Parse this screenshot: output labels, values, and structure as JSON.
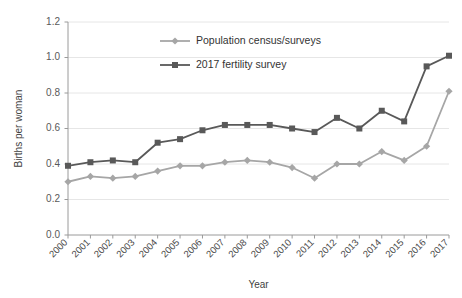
{
  "chart_data": {
    "type": "line",
    "title": "",
    "xlabel": "Year",
    "ylabel": "Births per woman",
    "categories": [
      "2000",
      "2001",
      "2002",
      "2003",
      "2004",
      "2005",
      "2006",
      "2007",
      "2008",
      "2009",
      "2010",
      "2011",
      "2012",
      "2013",
      "2014",
      "2015",
      "2016",
      "2017"
    ],
    "x": [
      2000,
      2001,
      2002,
      2003,
      2004,
      2005,
      2006,
      2007,
      2008,
      2009,
      2010,
      2011,
      2012,
      2013,
      2014,
      2015,
      2016,
      2017
    ],
    "ylim": [
      0.0,
      1.2
    ],
    "yticks": [
      0.0,
      0.2,
      0.4,
      0.6,
      0.8,
      1.0,
      1.2
    ],
    "ytick_labels": [
      "0.0",
      "0.2",
      "0.4",
      "0.6",
      "0.8",
      "1.0",
      "1.2"
    ],
    "grid": "horizontal",
    "legend_position": "inside-top-center",
    "series": [
      {
        "name": "Population census/surveys",
        "color": "#a6a6a6",
        "marker": "diamond",
        "values": [
          0.3,
          0.33,
          0.32,
          0.33,
          0.36,
          0.39,
          0.39,
          0.41,
          0.42,
          0.41,
          0.38,
          0.32,
          0.4,
          0.4,
          0.47,
          0.42,
          0.5,
          0.81
        ]
      },
      {
        "name": "2017 fertility survey",
        "color": "#595959",
        "marker": "square",
        "values": [
          0.39,
          0.41,
          0.42,
          0.41,
          0.52,
          0.54,
          0.59,
          0.62,
          0.62,
          0.62,
          0.6,
          0.58,
          0.66,
          0.6,
          0.7,
          0.64,
          0.95,
          1.01
        ]
      }
    ]
  },
  "axis": {
    "y_title": "Births per woman",
    "x_title": "Year"
  },
  "legend": {
    "items": [
      {
        "label": "Population census/surveys"
      },
      {
        "label": "2017 fertility survey"
      }
    ]
  }
}
